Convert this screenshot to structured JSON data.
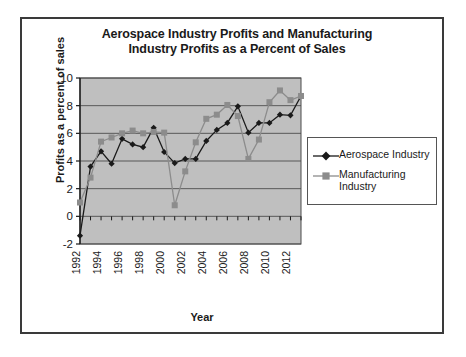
{
  "chart_data": {
    "type": "line",
    "title": "Aerospace Industry Profits and Manufacturing Industry Profits as a Percent of Sales",
    "title_line1": "Aerospace Industry Profits and Manufacturing",
    "title_line2": "Industry Profits as a Percent of Sales",
    "xlabel": "Year",
    "ylabel": "Profits as a percent of sales",
    "ylim": [
      -2,
      10
    ],
    "yticks": [
      -2,
      0,
      2,
      4,
      6,
      8,
      10
    ],
    "ytick_labels": [
      "-2",
      "0",
      "2",
      "4",
      "6",
      "8",
      "10"
    ],
    "grid": true,
    "legend_position": "right",
    "plot_background": "#bfbfbf",
    "x": [
      1992,
      1993,
      1994,
      1995,
      1996,
      1997,
      1998,
      1999,
      2000,
      2001,
      2002,
      2003,
      2004,
      2005,
      2006,
      2007,
      2008,
      2009,
      2010,
      2011,
      2012,
      2013
    ],
    "xtick_labels": [
      "1992",
      "1994",
      "1996",
      "1998",
      "2000",
      "2002",
      "2004",
      "2006",
      "2008",
      "2010",
      "2012"
    ],
    "xticks": [
      1992,
      1994,
      1996,
      1998,
      2000,
      2002,
      2004,
      2006,
      2008,
      2010,
      2012
    ],
    "series": [
      {
        "name": "Aerospace Industry",
        "color": "#1a1a1a",
        "marker": "diamond",
        "values": [
          -1.4,
          3.6,
          4.7,
          3.8,
          5.6,
          5.2,
          5.0,
          6.4,
          4.65,
          3.85,
          4.15,
          4.15,
          5.45,
          6.25,
          6.75,
          7.95,
          6.05,
          6.75,
          6.75,
          7.35,
          7.3,
          8.7
        ]
      },
      {
        "name": "Manufacturing Industry",
        "color": "#8c8c8c",
        "marker": "square",
        "values": [
          1.0,
          2.8,
          5.4,
          5.7,
          6.0,
          6.2,
          6.0,
          6.1,
          6.05,
          0.8,
          3.25,
          5.35,
          7.05,
          7.35,
          8.05,
          7.25,
          4.15,
          5.55,
          8.25,
          9.1,
          8.4,
          8.7
        ]
      }
    ]
  },
  "legend": {
    "items": [
      {
        "label": "Aerospace Industry",
        "color": "#1a1a1a",
        "marker": "diamond"
      },
      {
        "label": "Manufacturing Industry",
        "color": "#8c8c8c",
        "marker": "square"
      }
    ]
  }
}
